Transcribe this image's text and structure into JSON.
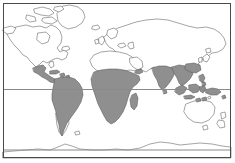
{
  "figure": {
    "type": "world-distribution-map",
    "title": "",
    "projection": "equirectangular",
    "background_color": "#ffffff",
    "frame": {
      "stroke_color": "#4a4a4a",
      "stroke_width": 1,
      "x": 3,
      "y": 3,
      "width": 228,
      "height": 155
    },
    "ocean_fill": "#ffffff",
    "land": {
      "fill": "#ffffff",
      "stroke_color": "#5a5a5a",
      "stroke_width": 0.55
    },
    "highlight": {
      "label": "shaded distribution range",
      "fill": "#8f8f8f",
      "stroke_color": "#5a5a5a",
      "stroke_width": 0.55,
      "regions": [
        "Central America",
        "Caribbean",
        "northern and central South America",
        "sub-Saharan Africa",
        "Madagascar",
        "South Asia (India)",
        "Southeast Asia",
        "Indonesia",
        "New Guinea"
      ]
    },
    "gridlines": [
      {
        "name": "equator",
        "y": 89.5,
        "color": "#8a8a8a",
        "width": 1
      },
      {
        "name": "antarctic-circle",
        "y": 150.0,
        "color": "#8a8a8a",
        "width": 1
      }
    ],
    "unshaded_landmasses": [
      "North America",
      "Europe",
      "northern Asia",
      "North Africa",
      "southern South America",
      "Australia",
      "New Zealand",
      "Antarctica",
      "Greenland"
    ]
  },
  "chart_data": {
    "type": "map",
    "title": "",
    "xlabel": "",
    "ylabel": "",
    "legend": [],
    "categories": [
      "shaded",
      "unshaded"
    ],
    "values": [
      1,
      0
    ]
  }
}
